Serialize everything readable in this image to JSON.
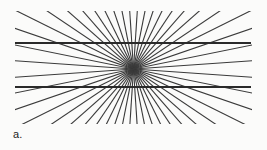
{
  "figure": {
    "panel_label": "a.",
    "background_color": "#fbfbfa",
    "line_color": "#2a2a2a",
    "radial_line_color": "#3a3a3a",
    "width": 267,
    "height": 150
  },
  "chart_data": {
    "type": "line",
    "subtitle": "Two parallel horizontal lines over a radial fan appear bowed outward",
    "xlabel": "",
    "ylabel": "",
    "xlim": [
      0,
      267
    ],
    "ylim": [
      0,
      150
    ],
    "grid": false,
    "legend_position": "none",
    "annotations": [
      "a."
    ],
    "vanishing_point": {
      "x": 133.5,
      "y": 69
    },
    "radial_fan": {
      "ray_count": 24,
      "angle_start_deg": -86,
      "angle_end_deg": 86,
      "ray_length": 240,
      "stroke_width": 1.1,
      "color": "#3a3a3a",
      "clip_top": 11,
      "clip_bottom": 124,
      "clip_left": 15,
      "clip_right": 252
    },
    "series": [
      {
        "name": "upper-horizontal-line",
        "x": [
          15,
          251
        ],
        "y": [
          43,
          43
        ],
        "color": "#2a2a2a",
        "stroke_width": 2.2
      },
      {
        "name": "lower-horizontal-line",
        "x": [
          15,
          251
        ],
        "y": [
          87,
          87
        ],
        "color": "#2a2a2a",
        "stroke_width": 2.2
      }
    ]
  }
}
